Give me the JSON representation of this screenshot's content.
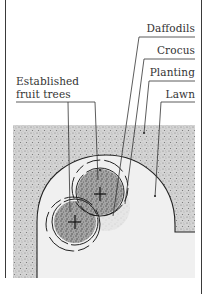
{
  "diagram": {
    "type": "garden-planting-plan",
    "labels": {
      "daffodils": "Daffodils",
      "crocus": "Crocus",
      "planting": "Planting",
      "lawn": "Lawn",
      "fruit_trees_line1": "Established",
      "fruit_trees_line2": "fruit trees"
    },
    "elements": [
      {
        "name": "Daffodils",
        "kind": "dashed-ring",
        "description": "Outer dashed ring of bulbs around each tree"
      },
      {
        "name": "Crocus",
        "kind": "solid-ring",
        "description": "Inner ring of bulbs under tree canopy"
      },
      {
        "name": "Planting",
        "kind": "stippled-area",
        "description": "Planted border around lawn"
      },
      {
        "name": "Lawn",
        "kind": "open-area",
        "description": "U-shaped grass area"
      },
      {
        "name": "Established fruit trees",
        "kind": "tree-center-cross",
        "count": 2
      }
    ],
    "colors": {
      "ink": "#2a2a2a",
      "stipple_base": "#d6d6d6",
      "stipple_dark": "#8a8a8a",
      "canopy_dark": "#9a9a9a",
      "lawn": "#efefef",
      "paper": "#ffffff"
    }
  }
}
